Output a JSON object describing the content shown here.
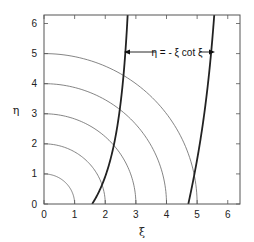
{
  "chart_data": {
    "type": "line",
    "title": "",
    "xlabel": "ξ",
    "ylabel": "η",
    "xlim": [
      0,
      6.4
    ],
    "ylim": [
      0,
      6.283
    ],
    "grid": false,
    "legend": null,
    "x_ticks": [
      0,
      1,
      2,
      3,
      4,
      5,
      6
    ],
    "y_ticks": [
      0,
      1,
      2,
      3,
      4,
      5,
      6
    ],
    "x_tick_labels": [
      "0",
      "1",
      "2",
      "3",
      "4",
      "5",
      "6"
    ],
    "y_tick_labels": [
      "0",
      "1",
      "2",
      "3",
      "4",
      "5",
      "6"
    ],
    "annotation": {
      "text": "η = - ξ cot ξ",
      "position": {
        "xi": 4.1,
        "eta": 4.5
      },
      "arrows": "left and right, pointing to both curve branches"
    },
    "series": [
      {
        "name": "circle R=1",
        "kind": "quarter-circle",
        "radius": 1,
        "style": "thin"
      },
      {
        "name": "circle R=2",
        "kind": "quarter-circle",
        "radius": 2,
        "style": "thin"
      },
      {
        "name": "circle R=3",
        "kind": "quarter-circle",
        "radius": 3,
        "style": "thin"
      },
      {
        "name": "circle R=4",
        "kind": "quarter-circle",
        "radius": 4,
        "style": "thin"
      },
      {
        "name": "circle R=5",
        "kind": "quarter-circle",
        "radius": 5,
        "style": "thin"
      },
      {
        "name": "η = -ξ cot ξ (branch 1)",
        "kind": "function",
        "xi_range": [
          1.5708,
          3.05
        ],
        "style": "thick",
        "points": [
          [
            1.5708,
            0
          ],
          [
            1.8,
            0.41
          ],
          [
            2.0,
            0.916
          ],
          [
            2.2,
            1.6
          ],
          [
            2.4,
            2.54
          ],
          [
            2.6,
            4.06
          ],
          [
            2.7,
            5.33
          ],
          [
            2.76,
            6.28
          ]
        ]
      },
      {
        "name": "η = -ξ cot ξ (branch 2)",
        "kind": "function",
        "xi_range": [
          4.7124,
          6.0
        ],
        "style": "thick",
        "points": [
          [
            4.7124,
            0
          ],
          [
            4.9,
            0.93
          ],
          [
            5.0,
            1.48
          ],
          [
            5.2,
            2.69
          ],
          [
            5.4,
            4.35
          ],
          [
            5.55,
            6.28
          ]
        ]
      }
    ]
  }
}
